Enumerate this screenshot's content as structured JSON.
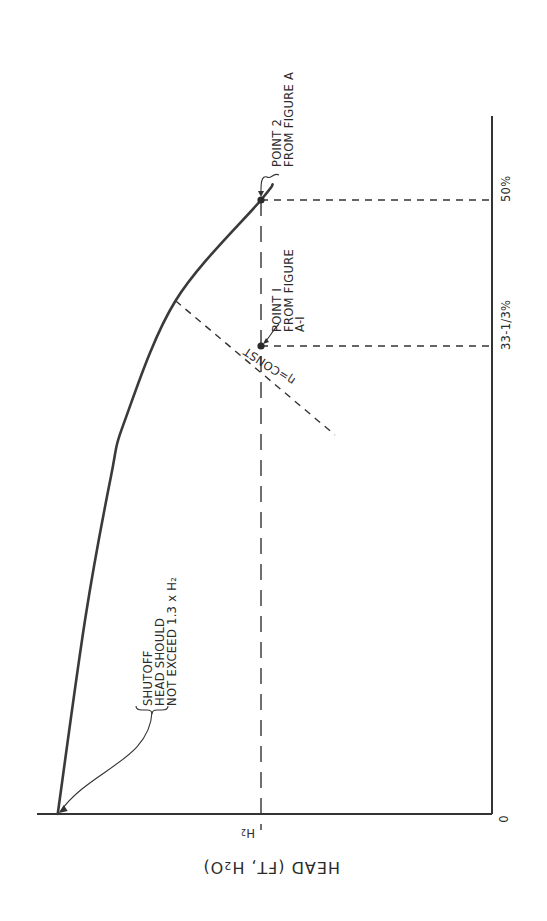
{
  "chart_data": {
    "type": "line",
    "orientation": "rotated-90-ccw",
    "title": "",
    "head_axis": {
      "label": "HEAD (FT, H₂O)",
      "label_parts": {
        "main": "HEAD (FT, H",
        "sub": "2",
        "tail": "O)"
      },
      "units": "multiples of H2",
      "ticks": [
        {
          "value": 1.0,
          "label": "H₂",
          "label_main": "H",
          "label_sub": "2"
        }
      ]
    },
    "flow_axis": {
      "label": "",
      "units": "percent",
      "ticks": [
        {
          "value": 0,
          "label": "0"
        },
        {
          "value": 33.333,
          "label": "33-1/3%"
        },
        {
          "value": 50,
          "label": "50%"
        }
      ],
      "range": [
        0,
        52
      ]
    },
    "series": [
      {
        "name": "pump head curve",
        "points": [
          {
            "flow": 0,
            "head": 1.88
          },
          {
            "flow": 14,
            "head": 1.76
          },
          {
            "flow": 24,
            "head": 1.65
          },
          {
            "flow": 28,
            "head": 1.59
          },
          {
            "flow": 38.5,
            "head": 1.37
          },
          {
            "flow": 50,
            "head": 1.0
          },
          {
            "flow": 51.3,
            "head": 0.95
          }
        ]
      }
    ],
    "reference_lines": [
      {
        "name": "H2 line",
        "axis": "head",
        "value": 1.0,
        "style": "long-dash"
      },
      {
        "name": "50% line",
        "axis": "flow",
        "value": 50,
        "style": "dash"
      },
      {
        "name": "33-1/3% line",
        "axis": "flow",
        "value": 33.333,
        "style": "dash"
      },
      {
        "name": "efficiency line",
        "label": "η=CONST",
        "from": {
          "flow": 38.5,
          "head": 1.37
        },
        "to": {
          "flow": 27,
          "head": 0.68
        },
        "style": "dash"
      }
    ],
    "points": [
      {
        "name": "Point 1",
        "flow": 33.333,
        "head": 1.0,
        "label_lines": [
          "POINT I",
          "FROM FIGURE",
          "A-I"
        ]
      },
      {
        "name": "Point 2",
        "flow": 50,
        "head": 1.0,
        "label_lines": [
          "POINT 2",
          "FROM FIGURE  A"
        ]
      }
    ],
    "annotations": [
      {
        "name": "shutoff note",
        "lines": [
          "SHUTOFF",
          "HEAD SHOULD",
          "NOT EXCEED 1.3 x H₂"
        ],
        "target": {
          "flow": 0,
          "head": 1.88
        }
      }
    ],
    "efficiency_label": "η=CONST",
    "grid": false,
    "legend": "none"
  }
}
